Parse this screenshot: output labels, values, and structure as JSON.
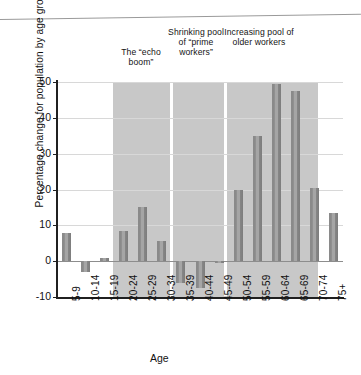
{
  "chart_data": {
    "type": "bar",
    "title": "",
    "xlabel": "Age",
    "ylabel": "Percentage change for population by age group",
    "categories": [
      "5-9",
      "10-14",
      "15-19",
      "20-24",
      "25-29",
      "30-34",
      "35-39",
      "40-44",
      "45-49",
      "50-54",
      "55-59",
      "60-64",
      "65-69",
      "70-74",
      "75+"
    ],
    "values": [
      8,
      -3,
      1,
      8.5,
      15,
      5.5,
      -6,
      -7.5,
      -0.5,
      20,
      35,
      49.5,
      47.5,
      20.5,
      13.5
    ],
    "ylim": [
      -10,
      50
    ],
    "yticks": [
      -10,
      0,
      10,
      20,
      30,
      40,
      50
    ],
    "ytick_labels": [
      "-10",
      "0",
      "10",
      "20",
      "30",
      "40",
      "50"
    ],
    "grid": true,
    "legend": "none",
    "bar_color": "#8c8c8c",
    "band_color": "#c8c8c8",
    "annotations": [
      {
        "text": "The “echo boom”",
        "categories": [
          "20-24",
          "25-29",
          "30-34"
        ]
      },
      {
        "text": "Shrinking pool of “prime workers”",
        "categories": [
          "35-39",
          "40-44",
          "45-49"
        ]
      },
      {
        "text": "Increasing pool of older workers",
        "categories": [
          "50-54",
          "55-59",
          "60-64",
          "65-69",
          "70-74"
        ]
      }
    ]
  },
  "annotations": {
    "echo_boom": "The “echo boom”",
    "prime_workers": "Shrinking pool of “prime workers”",
    "older_workers": "Increasing pool of older workers"
  },
  "axis": {
    "x_title": "Age",
    "y_title": "Percentage change for population by age group"
  }
}
